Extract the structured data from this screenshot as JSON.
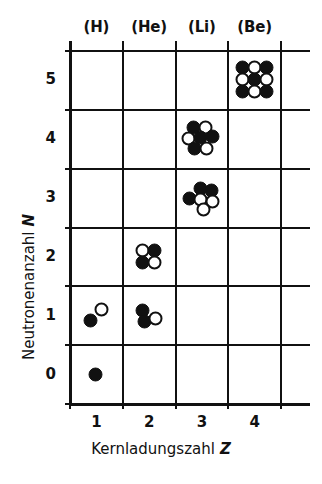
{
  "chart_data": {
    "type": "scatter",
    "title": "",
    "xlabel": "Kernladungszahl",
    "xlabel_symbol": "Z",
    "ylabel": "Neutronenanzahl",
    "ylabel_symbol": "N",
    "xticks": [
      "1",
      "2",
      "3",
      "4"
    ],
    "yticks": [
      "0",
      "1",
      "2",
      "3",
      "4",
      "5"
    ],
    "xlim": [
      0.5,
      4.5
    ],
    "ylim": [
      -0.5,
      5.5
    ],
    "grid": true,
    "legend": "none",
    "column_labels": [
      "(H)",
      "(He)",
      "(Li)",
      "(Be)"
    ],
    "marker_colors": {
      "proton": "#111111",
      "neutron": "#ffffff",
      "outline": "#111111"
    },
    "points": [
      {
        "name": "hydrogen-1",
        "element": "(H)",
        "z": 1,
        "n": 0,
        "protons": 1,
        "neutrons": 0,
        "nucleons": 1
      },
      {
        "name": "hydrogen-2",
        "element": "(H)",
        "z": 1,
        "n": 1,
        "protons": 1,
        "neutrons": 1,
        "nucleons": 2
      },
      {
        "name": "helium-3",
        "element": "(He)",
        "z": 2,
        "n": 1,
        "protons": 2,
        "neutrons": 1,
        "nucleons": 3
      },
      {
        "name": "helium-4",
        "element": "(He)",
        "z": 2,
        "n": 2,
        "protons": 2,
        "neutrons": 2,
        "nucleons": 4
      },
      {
        "name": "lithium-6",
        "element": "(Li)",
        "z": 3,
        "n": 3,
        "protons": 3,
        "neutrons": 3,
        "nucleons": 6
      },
      {
        "name": "lithium-7",
        "element": "(Li)",
        "z": 3,
        "n": 4,
        "protons": 3,
        "neutrons": 4,
        "nucleons": 7
      },
      {
        "name": "beryllium-9",
        "element": "(Be)",
        "z": 4,
        "n": 5,
        "protons": 4,
        "neutrons": 5,
        "nucleons": 9
      }
    ]
  },
  "geometry": {
    "plot_left": 70,
    "plot_right": 281,
    "plot_top": 51,
    "plot_bottom": 404,
    "grid_overhang_right": 29,
    "cell_w": 52.75,
    "cell_h": 58.83,
    "column_label_y": 18,
    "nucleon_radius": 7.0,
    "clusters": {
      "hydrogen-1": [
        {
          "kind": "proton",
          "dx": 0,
          "dy": 0
        }
      ],
      "hydrogen-2": [
        {
          "kind": "proton",
          "dx": -5,
          "dy": 5
        },
        {
          "kind": "neutron",
          "dx": 6,
          "dy": -6
        }
      ],
      "helium-3": [
        {
          "kind": "proton",
          "dx": -6,
          "dy": -5
        },
        {
          "kind": "proton",
          "dx": -4,
          "dy": 6
        },
        {
          "kind": "neutron",
          "dx": 7,
          "dy": 3
        }
      ],
      "helium-4": [
        {
          "kind": "neutron",
          "dx": -6,
          "dy": -6
        },
        {
          "kind": "proton",
          "dx": 6,
          "dy": -6
        },
        {
          "kind": "proton",
          "dx": -6,
          "dy": 6
        },
        {
          "kind": "neutron",
          "dx": 6,
          "dy": 6
        }
      ],
      "lithium-6": [
        {
          "kind": "proton",
          "dx": -12,
          "dy": 1
        },
        {
          "kind": "proton",
          "dx": -1,
          "dy": -9
        },
        {
          "kind": "proton",
          "dx": 10,
          "dy": -7
        },
        {
          "kind": "neutron",
          "dx": -1,
          "dy": 2
        },
        {
          "kind": "neutron",
          "dx": 11,
          "dy": 4
        },
        {
          "kind": "neutron",
          "dx": 2,
          "dy": 12
        }
      ],
      "lithium-7": [
        {
          "kind": "proton",
          "dx": -8,
          "dy": -11
        },
        {
          "kind": "neutron",
          "dx": 4,
          "dy": -11
        },
        {
          "kind": "neutron",
          "dx": -13,
          "dy": 0
        },
        {
          "kind": "proton",
          "dx": -1,
          "dy": -1
        },
        {
          "kind": "proton",
          "dx": 11,
          "dy": -2
        },
        {
          "kind": "proton",
          "dx": -7,
          "dy": 10
        },
        {
          "kind": "neutron",
          "dx": 5,
          "dy": 10
        }
      ],
      "beryllium-9": [
        {
          "kind": "proton",
          "dx": -12,
          "dy": -12
        },
        {
          "kind": "neutron",
          "dx": 0,
          "dy": -12
        },
        {
          "kind": "proton",
          "dx": 12,
          "dy": -12
        },
        {
          "kind": "neutron",
          "dx": -12,
          "dy": 0
        },
        {
          "kind": "proton",
          "dx": 0,
          "dy": 0
        },
        {
          "kind": "neutron",
          "dx": 12,
          "dy": 0
        },
        {
          "kind": "proton",
          "dx": -12,
          "dy": 12
        },
        {
          "kind": "neutron",
          "dx": 0,
          "dy": 12
        },
        {
          "kind": "proton",
          "dx": 12,
          "dy": 12
        }
      ]
    }
  }
}
